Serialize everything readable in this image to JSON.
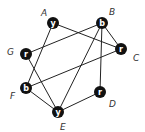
{
  "graph": {
    "nodes": [
      {
        "id": "A",
        "color_letter": "y",
        "x": 53,
        "y": 23,
        "label_x": 41,
        "label_y": 16
      },
      {
        "id": "B",
        "color_letter": "b",
        "x": 102,
        "y": 23,
        "label_x": 109,
        "label_y": 15
      },
      {
        "id": "C",
        "color_letter": "r",
        "x": 121,
        "y": 49,
        "label_x": 133,
        "label_y": 61
      },
      {
        "id": "D",
        "color_letter": "r",
        "x": 100,
        "y": 92,
        "label_x": 109,
        "label_y": 107
      },
      {
        "id": "E",
        "color_letter": "y",
        "x": 58,
        "y": 112,
        "label_x": 60,
        "label_y": 130
      },
      {
        "id": "F",
        "color_letter": "b",
        "x": 26,
        "y": 88,
        "label_x": 10,
        "label_y": 99
      },
      {
        "id": "G",
        "color_letter": "r",
        "x": 26,
        "y": 54,
        "label_x": 7,
        "label_y": 55
      }
    ],
    "edges": [
      [
        "A",
        "C"
      ],
      [
        "A",
        "F"
      ],
      [
        "B",
        "G"
      ],
      [
        "B",
        "C"
      ],
      [
        "B",
        "D"
      ],
      [
        "B",
        "E"
      ],
      [
        "C",
        "F"
      ],
      [
        "G",
        "E"
      ],
      [
        "F",
        "E"
      ],
      [
        "E",
        "D"
      ]
    ]
  }
}
